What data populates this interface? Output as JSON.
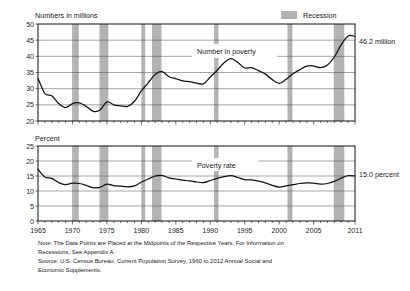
{
  "legend": {
    "recession_label": "Recession",
    "recession_color": "#b3b3b3"
  },
  "notes": {
    "line1": "Note:  The Data Points are Placed at the Midpoints of the Respective Years. For Information on",
    "line2": "Recessions, See Appendix A.",
    "line3": "Source:  U.S. Census Bureau, Current Population Survey, 1960 to 2012 Annual Social and",
    "line4": "Economic Supplements."
  },
  "chart_data": [
    {
      "id": "number-in-poverty",
      "type": "line",
      "title": "",
      "ylabel": "Numbers in millions",
      "xlabel": "",
      "series_label": "Number in poverty",
      "endpoint_label": "46.2 million",
      "ylim": [
        20,
        50
      ],
      "yticks": [
        20,
        25,
        30,
        35,
        40,
        45,
        50
      ],
      "xlim": [
        1965,
        2011
      ],
      "xticks": [
        1965,
        1970,
        1975,
        1980,
        1985,
        1990,
        1995,
        2000,
        2005,
        2011
      ],
      "grid": true,
      "legend_position": "top-right",
      "x": [
        1965,
        1966,
        1967,
        1968,
        1969,
        1970,
        1971,
        1972,
        1973,
        1974,
        1975,
        1976,
        1977,
        1978,
        1979,
        1980,
        1981,
        1982,
        1983,
        1984,
        1985,
        1986,
        1987,
        1988,
        1989,
        1990,
        1991,
        1992,
        1993,
        1994,
        1995,
        1996,
        1997,
        1998,
        1999,
        2000,
        2001,
        2002,
        2003,
        2004,
        2005,
        2006,
        2007,
        2008,
        2009,
        2010,
        2011
      ],
      "values": [
        33.2,
        28.5,
        27.8,
        25.4,
        24.1,
        25.4,
        25.6,
        24.5,
        23.0,
        23.4,
        25.9,
        25.0,
        24.7,
        24.5,
        26.1,
        29.3,
        31.8,
        34.4,
        35.3,
        33.7,
        33.1,
        32.4,
        32.2,
        31.7,
        31.5,
        33.6,
        35.7,
        38.0,
        39.3,
        38.1,
        36.4,
        36.5,
        35.6,
        34.5,
        32.8,
        31.6,
        32.9,
        34.6,
        35.9,
        37.0,
        37.0,
        36.5,
        37.3,
        39.8,
        43.6,
        46.3,
        46.2
      ]
    },
    {
      "id": "poverty-rate",
      "type": "line",
      "title": "",
      "ylabel": "Percent",
      "xlabel": "",
      "series_label": "Poverty rate",
      "endpoint_label": "15.0 percent",
      "ylim": [
        0,
        25
      ],
      "yticks": [
        0,
        5,
        10,
        15,
        20,
        25
      ],
      "xlim": [
        1965,
        2011
      ],
      "xticks": [
        1965,
        1970,
        1975,
        1980,
        1985,
        1990,
        1995,
        2000,
        2005,
        2011
      ],
      "grid": true,
      "x": [
        1965,
        1966,
        1967,
        1968,
        1969,
        1970,
        1971,
        1972,
        1973,
        1974,
        1975,
        1976,
        1977,
        1978,
        1979,
        1980,
        1981,
        1982,
        1983,
        1984,
        1985,
        1986,
        1987,
        1988,
        1989,
        1990,
        1991,
        1992,
        1993,
        1994,
        1995,
        1996,
        1997,
        1998,
        1999,
        2000,
        2001,
        2002,
        2003,
        2004,
        2005,
        2006,
        2007,
        2008,
        2009,
        2010,
        2011
      ],
      "values": [
        17.3,
        14.7,
        14.2,
        12.8,
        12.1,
        12.6,
        12.5,
        11.9,
        11.1,
        11.2,
        12.3,
        11.8,
        11.6,
        11.4,
        11.7,
        13.0,
        14.0,
        15.0,
        15.2,
        14.4,
        14.0,
        13.6,
        13.4,
        13.0,
        12.8,
        13.5,
        14.2,
        14.8,
        15.1,
        14.5,
        13.8,
        13.7,
        13.3,
        12.7,
        11.9,
        11.3,
        11.7,
        12.1,
        12.5,
        12.7,
        12.6,
        12.3,
        12.5,
        13.2,
        14.3,
        15.1,
        15.0
      ]
    }
  ],
  "recessions": [
    {
      "start": 1969.95,
      "end": 1970.92
    },
    {
      "start": 1973.92,
      "end": 1975.2
    },
    {
      "start": 1980.0,
      "end": 1980.55
    },
    {
      "start": 1981.55,
      "end": 1982.92
    },
    {
      "start": 1990.55,
      "end": 1991.2
    },
    {
      "start": 2001.2,
      "end": 2001.92
    },
    {
      "start": 2007.92,
      "end": 2009.45
    }
  ]
}
